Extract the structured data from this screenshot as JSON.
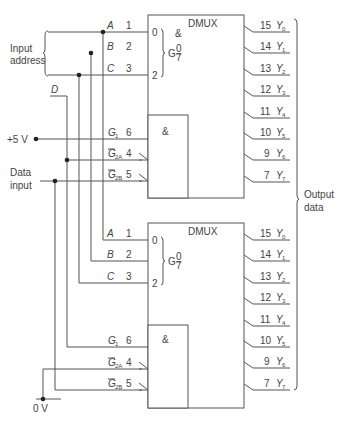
{
  "labels": {
    "input_address": [
      "Input",
      "address"
    ],
    "data_input": [
      "Data",
      "input"
    ],
    "output_data": [
      "Output",
      "data"
    ],
    "plus5v": "+5 V",
    "zero_v": "0 V",
    "d": "D"
  },
  "dmux": [
    {
      "title": "DMUX",
      "g_label": "G",
      "g_top": "0",
      "g_bottom": "7",
      "and_label": "&",
      "address_inputs": [
        {
          "name": "A",
          "pin": "1",
          "bit": "0"
        },
        {
          "name": "B",
          "pin": "2",
          "bit": ""
        },
        {
          "name": "C",
          "pin": "3",
          "bit": "2"
        }
      ],
      "enable_inputs": [
        {
          "name": "G",
          "sub": "1",
          "pin": "6",
          "bar": false
        },
        {
          "name": "G",
          "sub": "2A",
          "pin": "4",
          "bar": true
        },
        {
          "name": "G",
          "sub": "2B",
          "pin": "5",
          "bar": true
        }
      ],
      "outputs": [
        {
          "pin": "15",
          "name": "Y",
          "sub": "0"
        },
        {
          "pin": "14",
          "name": "Y",
          "sub": "1"
        },
        {
          "pin": "13",
          "name": "Y",
          "sub": "2"
        },
        {
          "pin": "12",
          "name": "Y",
          "sub": "3"
        },
        {
          "pin": "11",
          "name": "Y",
          "sub": "4"
        },
        {
          "pin": "10",
          "name": "Y",
          "sub": "5"
        },
        {
          "pin": "9",
          "name": "Y",
          "sub": "6"
        },
        {
          "pin": "7",
          "name": "Y",
          "sub": "7"
        }
      ]
    },
    {
      "title": "DMUX",
      "g_label": "G",
      "g_top": "0",
      "g_bottom": "7",
      "and_label": "&",
      "address_inputs": [
        {
          "name": "A",
          "pin": "1",
          "bit": "0"
        },
        {
          "name": "B",
          "pin": "2",
          "bit": ""
        },
        {
          "name": "C",
          "pin": "3",
          "bit": "2"
        }
      ],
      "enable_inputs": [
        {
          "name": "G",
          "sub": "1",
          "pin": "6",
          "bar": false
        },
        {
          "name": "G",
          "sub": "2A",
          "pin": "4",
          "bar": true
        },
        {
          "name": "G",
          "sub": "2B",
          "pin": "5",
          "bar": true
        }
      ],
      "outputs": [
        {
          "pin": "15",
          "name": "Y",
          "sub": "0"
        },
        {
          "pin": "14",
          "name": "Y",
          "sub": "1"
        },
        {
          "pin": "13",
          "name": "Y",
          "sub": "2"
        },
        {
          "pin": "12",
          "name": "Y",
          "sub": "3"
        },
        {
          "pin": "11",
          "name": "Y",
          "sub": "4"
        },
        {
          "pin": "10",
          "name": "Y",
          "sub": "5"
        },
        {
          "pin": "9",
          "name": "Y",
          "sub": "6"
        },
        {
          "pin": "7",
          "name": "Y",
          "sub": "7"
        }
      ]
    }
  ]
}
